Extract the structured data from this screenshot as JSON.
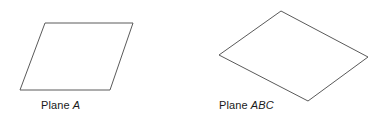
{
  "figure": {
    "background_color": "#ffffff",
    "stroke_color": "#5a5a5a",
    "text_color": "#1a1a1a",
    "width": 383,
    "height": 116,
    "shapes": [
      {
        "id": "plane-a",
        "icon": "parallelogram-plane-icon",
        "points": "45,23 133,23 110,90 20,90",
        "caption_prefix": "Plane",
        "caption_name": "A"
      },
      {
        "id": "plane-abc",
        "icon": "rhombus-plane-icon",
        "points": "281,11 368,57 308,101 219,55",
        "caption_prefix": "Plane",
        "caption_name": "ABC"
      }
    ]
  }
}
